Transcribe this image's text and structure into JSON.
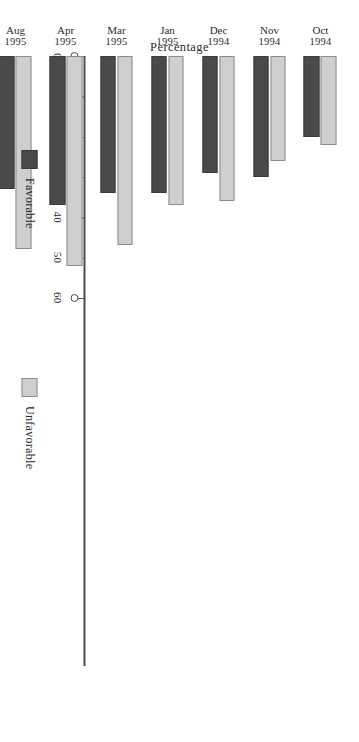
{
  "chart_data": {
    "type": "bar",
    "title": "",
    "subtitle": "",
    "xlabel": "",
    "ylabel": "Percentage",
    "ylim": [
      0,
      65
    ],
    "grid": false,
    "orientation": "vertical-bars-page-rotated-90",
    "legend_position": "below-plot",
    "y_ticks": [
      0,
      10,
      20,
      30,
      40,
      50,
      60
    ],
    "y_tick_labels": [
      "0",
      "10",
      "20",
      "30",
      "40",
      "50",
      "60"
    ],
    "categories": [
      "Oct 1994",
      "Nov 1994",
      "Dec 1994",
      "Jan 1995",
      "Mar 1995",
      "Apr 1995",
      "Aug 1995",
      "Jan 1996",
      "Mar 1996",
      "Aug 1996",
      "Oct 1996",
      "Jul 1997"
    ],
    "category_months": [
      "Oct",
      "Nov",
      "Dec",
      "Jan",
      "Mar",
      "Apr",
      "Aug",
      "Jan",
      "Mar",
      "Aug",
      "Oct",
      "Jul"
    ],
    "category_years": [
      "1994",
      "1994",
      "1994",
      "1995",
      "1995",
      "1995",
      "1995",
      "1996",
      "1996",
      "1996",
      "1996",
      "1997"
    ],
    "series": [
      {
        "name": "Favorable",
        "color": "#4a4a4a",
        "values": [
          20,
          30,
          29,
          34,
          34,
          37,
          33,
          32,
          23,
          34,
          27,
          19
        ]
      },
      {
        "name": "Unfavorable",
        "color": "#cfcfcf",
        "values": [
          22,
          26,
          36,
          37,
          47,
          52,
          48,
          57,
          60,
          57,
          61,
          55
        ]
      }
    ]
  },
  "axis": {
    "value_axis_title": "Percentage"
  },
  "legend": {
    "items": [
      {
        "label": "Favorable",
        "color": "#4a4a4a"
      },
      {
        "label": "Unfavorable",
        "color": "#cfcfcf"
      }
    ]
  }
}
